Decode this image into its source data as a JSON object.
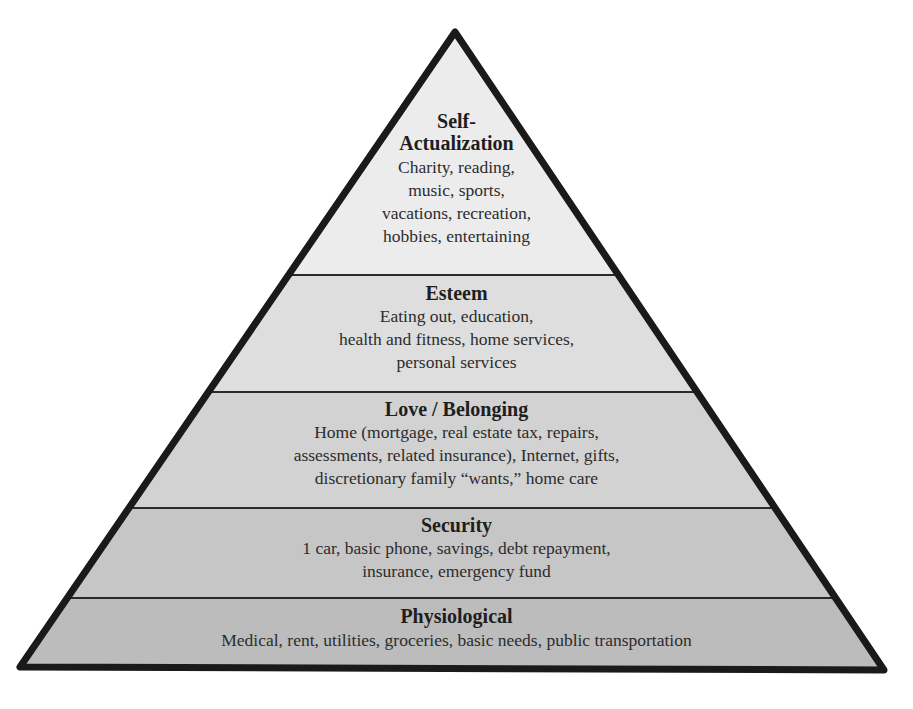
{
  "diagram": {
    "type": "pyramid",
    "levels": [
      {
        "title_lines": [
          "Self-",
          "Actualization"
        ],
        "desc_lines": [
          "Charity, reading,",
          "music, sports,",
          "vacations, recreation,",
          "hobbies, entertaining"
        ],
        "fill": "#ececec"
      },
      {
        "title_lines": [
          "Esteem"
        ],
        "desc_lines": [
          "Eating out, education,",
          "health and fitness, home services,",
          "personal services"
        ],
        "fill": "#dedede"
      },
      {
        "title_lines": [
          "Love / Belonging"
        ],
        "desc_lines": [
          "Home (mortgage, real estate tax, repairs,",
          "assessments, related insurance), Internet, gifts,",
          "discretionary family “wants,” home care"
        ],
        "fill": "#d2d2d2"
      },
      {
        "title_lines": [
          "Security"
        ],
        "desc_lines": [
          "1 car, basic phone, savings, debt repayment,",
          "insurance, emergency fund"
        ],
        "fill": "#c6c6c6"
      },
      {
        "title_lines": [
          "Physiological"
        ],
        "desc_lines": [
          "Medical, rent, utilities, groceries, basic needs, public transportation"
        ],
        "fill": "#bcbcbc"
      }
    ],
    "outline_color": "#1a1a1a",
    "divider_color": "#2a2a2a"
  }
}
